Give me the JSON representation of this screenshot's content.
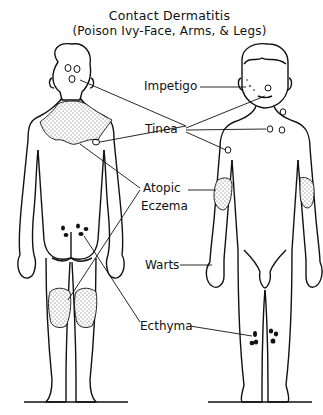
{
  "title": {
    "line1": "Contact Dermatitis",
    "line2": "(Poison Ivy-Face, Arms, & Legs)"
  },
  "labels": {
    "impetigo": "Impetigo",
    "tinea": "Tinea",
    "atopic": "Atopic",
    "eczema": "Eczema",
    "warts": "Warts",
    "ecthyma": "Ecthyma"
  },
  "figures": {
    "back_view": "child-back-view",
    "front_view": "child-front-view"
  },
  "colors": {
    "ink": "#111111",
    "background": "#ffffff",
    "stipple": "#555555"
  }
}
